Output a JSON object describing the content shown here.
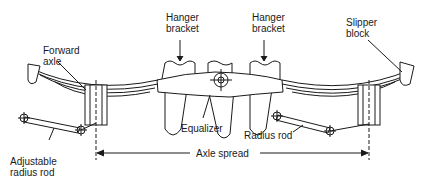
{
  "diagram": {
    "labels": {
      "hanger_bracket_left": "Hanger\nbracket",
      "hanger_bracket_right": "Hanger\nbracket",
      "slipper_block": "Slipper\nblock",
      "forward_axle": "Forward\naxle",
      "equalizer": "Equalizer",
      "radius_rod": "Radius rod",
      "adjustable_radius_rod": "Adjustable\nradius rod",
      "axle_spread": "Axle spread"
    }
  }
}
